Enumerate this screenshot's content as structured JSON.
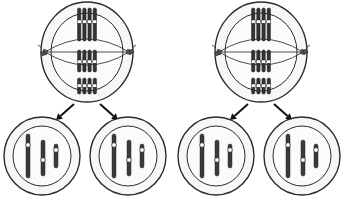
{
  "diagram": {
    "panel_count": 2,
    "panels": [
      {
        "id": "panel-left",
        "label": "Cell division sequence, left"
      },
      {
        "id": "panel-right",
        "label": "Cell division sequence, right"
      }
    ]
  },
  "colors": {
    "background": "#ffffff",
    "cell_fill": "#f7f7f7",
    "cell_outline": "#2b2b2b",
    "inner_fill": "#fbfbfb",
    "chromosome": "#333333",
    "daughter_chromosome": "#3a3a3a",
    "centromere": "#ffffff",
    "centriole": "#555555",
    "spindle_fiber": "#3a3a3a",
    "arrow": "#111111"
  },
  "parent_cell": {
    "name": "dividing parent cell",
    "stage": "metaphase",
    "outer_membrane": {
      "cx": 87,
      "cy": 52,
      "rx": 46,
      "ry": 50
    },
    "inner_membrane": {
      "cx": 87,
      "cy": 52,
      "rx": 36,
      "ry": 39
    },
    "chromosome_rows": [
      {
        "row": 1,
        "length": 33,
        "y_top": 8,
        "chromatids": 4,
        "centromere_offset": 12
      },
      {
        "row": 2,
        "length": 22,
        "y_top": 50,
        "chromatids": 4,
        "centromere_offset": 10
      },
      {
        "row": 3,
        "length": 16,
        "y_top": 78,
        "chromatids": 4,
        "centromere_offset": 6
      }
    ],
    "chromatid_width": 3.4,
    "chromatid_gap": 5.2,
    "spindle": {
      "fiber_count": 3,
      "equator_y": 52,
      "pole_left_x": 45,
      "pole_right_x": 129
    },
    "centrioles": [
      {
        "side": "left",
        "x": 45,
        "y": 52
      },
      {
        "side": "right",
        "x": 129,
        "y": 52
      }
    ]
  },
  "arrows": [
    {
      "name": "arrow-to-left-daughter",
      "from_x": 74,
      "from_y": 104,
      "to_x": 56,
      "to_y": 120
    },
    {
      "name": "arrow-to-right-daughter",
      "from_x": 100,
      "from_y": 104,
      "to_x": 118,
      "to_y": 120
    }
  ],
  "daughter_cells": [
    {
      "name": "left daughter cell",
      "outer_membrane": {
        "cx": 42,
        "cy": 156,
        "rx": 38,
        "ry": 39
      },
      "inner_membrane": {
        "cx": 42,
        "cy": 156,
        "rx": 29,
        "ry": 30
      },
      "chromosomes": [
        {
          "id": "long",
          "x": 28,
          "y_top": 134,
          "length": 44,
          "width": 4.0,
          "centromere_y": 145
        },
        {
          "id": "medium",
          "x": 43,
          "y_top": 140,
          "length": 36,
          "width": 4.0,
          "centromere_y": 160
        },
        {
          "id": "short",
          "x": 56,
          "y_top": 144,
          "length": 24,
          "width": 4.0,
          "centromere_y": 150
        }
      ]
    },
    {
      "name": "right daughter cell",
      "outer_membrane": {
        "cx": 128,
        "cy": 156,
        "rx": 38,
        "ry": 39
      },
      "inner_membrane": {
        "cx": 128,
        "cy": 156,
        "rx": 29,
        "ry": 30
      },
      "chromosomes": [
        {
          "id": "long",
          "x": 114,
          "y_top": 134,
          "length": 44,
          "width": 4.0,
          "centromere_y": 145
        },
        {
          "id": "medium",
          "x": 129,
          "y_top": 140,
          "length": 36,
          "width": 4.0,
          "centromere_y": 160
        },
        {
          "id": "short",
          "x": 142,
          "y_top": 144,
          "length": 24,
          "width": 4.0,
          "centromere_y": 150
        }
      ]
    }
  ]
}
